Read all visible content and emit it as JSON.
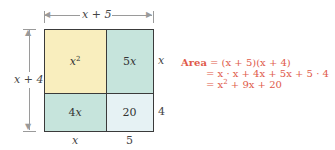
{
  "diagram": {
    "type": "area-model",
    "colors": {
      "x_squared_tile": "#f9eebe",
      "linear_tiles": "#c6e4dc",
      "constant_tile": "#e6f2f4",
      "border": "#3a3a3a",
      "equation_text": "#e05a4a"
    },
    "top_dimension": "x + 5",
    "left_dimension": "x + 4",
    "tiles": {
      "top_left": {
        "base": "x",
        "exp": "2"
      },
      "top_right": {
        "coef": "5",
        "var": "x"
      },
      "bottom_left": {
        "coef": "4",
        "var": "x"
      },
      "bottom_right": "20"
    },
    "right_labels": {
      "top": "x",
      "bottom": "4"
    },
    "bottom_labels": {
      "left": "x",
      "right": "5"
    }
  },
  "equation": {
    "label": "Area",
    "line1": "= (x + 5)(x + 4)",
    "line2": "= x · x + 4x + 5x + 5 · 4",
    "line3_prefix": "= x",
    "line3_exp": "2",
    "line3_suffix": " + 9x + 20"
  }
}
